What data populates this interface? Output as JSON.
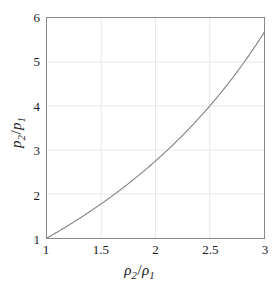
{
  "chart_data": {
    "type": "line",
    "title": "",
    "subtitle": "",
    "xlabel_plain": "rho_2/rho_1",
    "ylabel_plain": "p_2/p_1",
    "xlabel_parts": {
      "symbol": "ρ",
      "num_sub": "2",
      "den_sub": "1",
      "slash": "/"
    },
    "ylabel_parts": {
      "symbol": "p",
      "num_sub": "2",
      "den_sub": "1",
      "slash": "/"
    },
    "xlim": [
      1,
      3
    ],
    "ylim": [
      1,
      6
    ],
    "xticks": [
      1,
      1.5,
      2,
      2.5,
      3
    ],
    "xtick_labels": [
      "1",
      "1.5",
      "2",
      "2.5",
      "3"
    ],
    "yticks": [
      1,
      2,
      3,
      4,
      5,
      6
    ],
    "ytick_labels": [
      "1",
      "2",
      "3",
      "4",
      "5",
      "6"
    ],
    "grid": true,
    "grid_color": "#e8e8e8",
    "frame_color": "#8a8a8a",
    "background": "#ffffff",
    "legend": null,
    "legend_position": "none",
    "series": [
      {
        "name": "Rankine-Hugoniot (gamma = 1.4)",
        "color": "#808080",
        "line_width": 1.1,
        "x": [
          1.0,
          1.05,
          1.1,
          1.15,
          1.2,
          1.25,
          1.3,
          1.35,
          1.4,
          1.45,
          1.5,
          1.55,
          1.6,
          1.65,
          1.7,
          1.75,
          1.8,
          1.85,
          1.9,
          1.95,
          2.0,
          2.05,
          2.1,
          2.15,
          2.2,
          2.25,
          2.3,
          2.35,
          2.4,
          2.45,
          2.5,
          2.55,
          2.6,
          2.65,
          2.7,
          2.75,
          2.8,
          2.85,
          2.9,
          2.95,
          3.0
        ],
        "y": [
          1.0,
          1.061,
          1.124,
          1.189,
          1.25,
          1.316,
          1.383,
          1.452,
          1.522,
          1.593,
          1.667,
          1.742,
          1.818,
          1.897,
          1.977,
          2.059,
          2.143,
          2.229,
          2.317,
          2.407,
          2.5,
          2.595,
          2.692,
          2.792,
          2.895,
          3.0,
          3.108,
          3.22,
          3.333,
          3.451,
          3.571,
          3.696,
          3.824,
          3.955,
          4.091,
          4.231,
          4.375,
          4.524,
          4.677,
          4.836,
          5.0
        ]
      }
    ],
    "annotations": [],
    "notable_points": [
      {
        "x": 1.0,
        "y": 1.0,
        "label": "origin of curve"
      },
      {
        "x": 2.0,
        "y": 2.78,
        "label": "midpoint reading"
      },
      {
        "x": 2.5,
        "y": 4.0,
        "label": "crosses p2/p1 = 4"
      },
      {
        "x": 3.0,
        "y": 5.62,
        "label": "right endpoint"
      }
    ]
  }
}
